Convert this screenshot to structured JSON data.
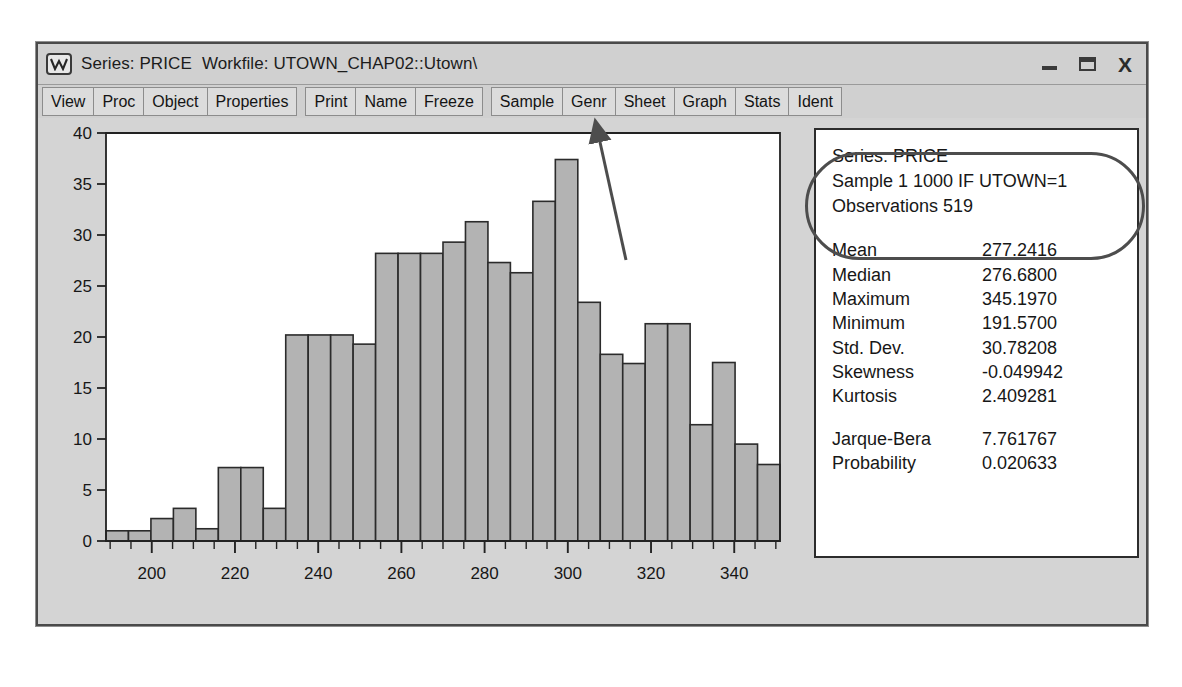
{
  "window": {
    "icon": "series-chart-icon",
    "title_series": "Series: PRICE",
    "title_workfile": "Workfile: UTOWN_CHAP02::Utown\\",
    "controls": {
      "minimize": "minimize-icon",
      "maximize": "maximize-icon",
      "close": "X"
    }
  },
  "toolbar": {
    "group1": [
      "View",
      "Proc",
      "Object",
      "Properties"
    ],
    "group2": [
      "Print",
      "Name",
      "Freeze"
    ],
    "group3": [
      "Sample",
      "Genr",
      "Sheet",
      "Graph",
      "Stats",
      "Ident"
    ]
  },
  "stats": {
    "header": [
      "Series: PRICE",
      "Sample 1 1000 IF UTOWN=1",
      "Observations 519"
    ],
    "rows": [
      {
        "label": "Mean",
        "value": "277.2416"
      },
      {
        "label": "Median",
        "value": "276.6800"
      },
      {
        "label": "Maximum",
        "value": "345.1970"
      },
      {
        "label": "Minimum",
        "value": "191.5700"
      },
      {
        "label": "Std. Dev.",
        "value": "30.78208"
      },
      {
        "label": "Skewness",
        "value": "-0.049942"
      },
      {
        "label": "Kurtosis",
        "value": "2.409281"
      }
    ],
    "rows2": [
      {
        "label": "Jarque-Bera",
        "value": "7.761767"
      },
      {
        "label": "Probability",
        "value": "0.020633"
      }
    ]
  },
  "annotations": {
    "oval_target": "series-sample-observations-header",
    "arrow_target": "Sample"
  },
  "colors": {
    "bar_fill": "#b3b3b3",
    "bar_stroke": "#2b2b2b",
    "plot_bg": "#ffffff",
    "window_bg": "#d4d4d4",
    "toolbar_btn": "#dcdcdc",
    "annotation": "#4d4d4d"
  },
  "chart_data": {
    "type": "bar",
    "title": "",
    "xlabel": "",
    "ylabel": "",
    "xlim": [
      189,
      351
    ],
    "ylim": [
      0,
      40
    ],
    "ytick_step": 5,
    "yticks": [
      0,
      5,
      10,
      15,
      20,
      25,
      30,
      35,
      40
    ],
    "xticks": [
      200,
      220,
      240,
      260,
      280,
      300,
      320,
      340
    ],
    "xtick_minor_step": 5,
    "grid": false,
    "legend": null,
    "bin_width": 5.4,
    "bin_starts": [
      189,
      194.4,
      199.8,
      205.2,
      210.6,
      216,
      221.4,
      226.8,
      232.2,
      237.6,
      243,
      248.4,
      253.8,
      259.2,
      264.6,
      270,
      275.4,
      280.8,
      286.2,
      291.6,
      297,
      302.4,
      307.8,
      313.2,
      318.6,
      324,
      329.4,
      334.8,
      340.2,
      345.6
    ],
    "categories": [
      "189-194",
      "194-200",
      "200-205",
      "205-211",
      "211-216",
      "216-221",
      "221-227",
      "227-232",
      "232-238",
      "238-243",
      "243-248",
      "248-254",
      "254-259",
      "259-265",
      "265-270",
      "270-275",
      "275-281",
      "281-286",
      "286-292",
      "292-297",
      "297-302",
      "302-308",
      "308-313",
      "313-319",
      "319-324",
      "324-329",
      "329-335",
      "335-340",
      "340-346",
      "346-351"
    ],
    "values": [
      1.0,
      1.0,
      2.2,
      3.2,
      1.2,
      7.2,
      7.2,
      3.2,
      20.2,
      20.2,
      20.2,
      19.3,
      28.2,
      28.2,
      28.2,
      29.3,
      31.3,
      27.3,
      26.3,
      33.3,
      37.4,
      23.4,
      18.3,
      17.4,
      21.3,
      21.3,
      11.4,
      17.5,
      9.5,
      7.5
    ]
  }
}
